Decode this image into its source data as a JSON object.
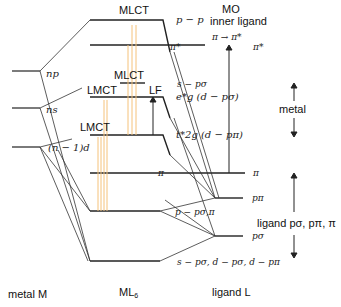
{
  "columns": {
    "metal": "metal M",
    "complex": "ML",
    "complex_sub": "6",
    "ligand": "ligand L"
  },
  "metal_levels": {
    "np": "np",
    "ns": "ns",
    "nd": "(n − 1)d"
  },
  "mo_levels": {
    "top": "p − p",
    "pi_star": "π*",
    "s_psigma": "s − pσ",
    "eg": "e*g (d − pσ)",
    "t2g": "t*2g (d − pπ)",
    "pi": "π",
    "p_psigma_pi": "p − pσ,π",
    "bottom": "s − pσ, d − pσ, d − pπ"
  },
  "ligand_levels": {
    "pi_star": "π*",
    "pi": "π",
    "p_pi": "pπ",
    "p_sigma": "pσ"
  },
  "transitions": {
    "mlct_top": "MLCT",
    "mlct_mid": "MLCT",
    "lmct_upper": "LMCT",
    "lmct_lower": "LMCT",
    "lf": "LF",
    "mo_header": "MO",
    "inner_ligand": "inner ligand",
    "pi_pi_star": "π → π*"
  },
  "region_labels": {
    "metal": "metal",
    "ligand": "ligand pσ, pπ, π"
  },
  "colors": {
    "line": "#222222",
    "transition": "#f5c27a",
    "transition_dark": "#e8a040"
  }
}
